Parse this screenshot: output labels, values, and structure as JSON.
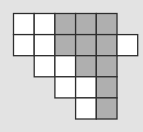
{
  "diagram": {
    "title": "",
    "colors": {
      "background": "#e3e3e3",
      "white": "#ffffff",
      "gray": "#afafaf",
      "border": "#2e2e2e"
    },
    "rows": [
      [
        "W",
        "W",
        "G",
        "G",
        "G",
        "."
      ],
      [
        "W",
        "W",
        "G",
        "G",
        "G",
        "W"
      ],
      [
        ".",
        "W",
        "W",
        "G",
        "G",
        "."
      ],
      [
        ".",
        ".",
        "W",
        "W",
        "G",
        "."
      ],
      [
        ".",
        ".",
        ".",
        "W",
        "G",
        "."
      ]
    ],
    "legend": {
      "W": "white square",
      "G": "gray (shaded) square",
      ".": "empty"
    },
    "counts": {
      "white": 10,
      "gray": 11,
      "total": 21
    }
  }
}
